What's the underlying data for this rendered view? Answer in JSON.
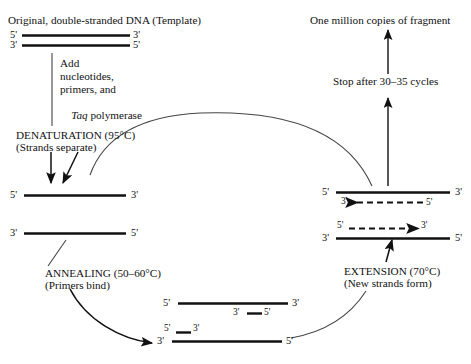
{
  "diagram": {
    "background_color": "#ffffff",
    "ink_color": "#111111"
  },
  "headings": {
    "template": "Original, double-stranded DNA (Template)",
    "product": "One million copies of fragment"
  },
  "steps": {
    "add_reagents": {
      "line1": "Add",
      "line2": "nucleotides,",
      "line3": "primers, and",
      "line4_italic": "Taq",
      "line4_rest": " polymerase"
    },
    "denaturation": {
      "title": "DENATURATION (95°C)",
      "subtitle": "(Strands separate)"
    },
    "annealing": {
      "title": "ANNEALING (50–60°C)",
      "subtitle": "(Primers bind)"
    },
    "extension": {
      "title": "EXTENSION (70°C)",
      "subtitle": "(New strands form)"
    },
    "stop": {
      "text": "Stop after 30–35 cycles"
    }
  },
  "strands": {
    "template_top": {
      "left_end": "5'",
      "right_end": "3'"
    },
    "template_bottom": {
      "left_end": "3'",
      "right_end": "5'"
    },
    "separated_top": {
      "left_end": "5'",
      "right_end": "3'"
    },
    "separated_bottom": {
      "left_end": "3'",
      "right_end": "5'"
    },
    "annealed_top": {
      "left_end": "5'",
      "right_end": "3'",
      "primer_left": "3'",
      "primer_right": "5'"
    },
    "annealed_bottom": {
      "left_end": "3'",
      "right_end": "5'",
      "primer_left": "5'",
      "primer_right": "3'"
    },
    "extension_top": {
      "left_end": "5'",
      "right_end": "3'",
      "arrow_head_label": "3'",
      "arrow_tail_label": "5'"
    },
    "extension_bottom": {
      "left_end": "3'",
      "right_end": "5'",
      "arrow_tail_label": "5'",
      "arrow_head_label": "3'"
    }
  },
  "icons": {
    "flow_arrow": "arrow-icon",
    "dashed_synthesis_arrow": "dashed-arrow-icon",
    "cycle_curve": "curved-arrow-icon"
  }
}
